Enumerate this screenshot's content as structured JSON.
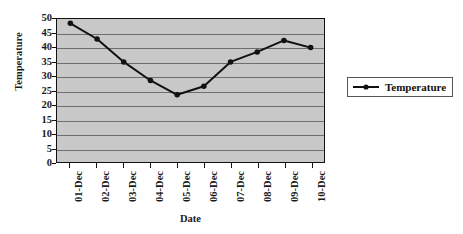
{
  "chart_data": {
    "type": "line",
    "title": "",
    "xlabel": "Date",
    "ylabel": "Temperature",
    "categories": [
      "01-Dec",
      "02-Dec",
      "03-Dec",
      "04-Dec",
      "05-Dec",
      "06-Dec",
      "07-Dec",
      "08-Dec",
      "09-Dec",
      "10-Dec"
    ],
    "series": [
      {
        "name": "Temperature",
        "values": [
          48.5,
          43,
          35,
          28.5,
          23.5,
          26.5,
          35,
          38.5,
          42.5,
          40
        ]
      }
    ],
    "ylim": [
      0,
      50
    ],
    "ytick_step": 5,
    "yticks": [
      50,
      45,
      40,
      35,
      30,
      25,
      20,
      15,
      10,
      5,
      0
    ],
    "grid": true,
    "grid_axis": "y",
    "legend": true,
    "legend_position": "right",
    "legend_entries": [
      "Temperature"
    ],
    "colors": {
      "plot_background": "#c8c8c8",
      "gridline": "#6e6e6e",
      "series_line": "#111111",
      "marker": "#111111",
      "axis": "#111111",
      "text": "#1a1a1a",
      "figure_background": "#ffffff",
      "legend_border": "#555555"
    }
  }
}
